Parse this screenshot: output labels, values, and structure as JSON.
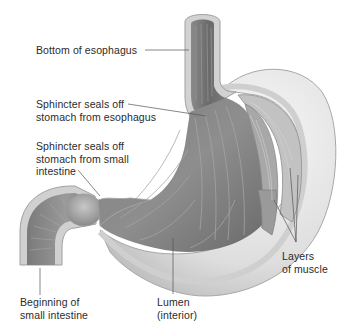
{
  "diagram": {
    "labels": [
      {
        "id": "bottom-esophagus",
        "text": "Bottom of esophagus",
        "x": 36,
        "y": 45
      },
      {
        "id": "sphincter-esophagus",
        "text": "Sphincter seals off\nstomach from esophagus",
        "x": 36,
        "y": 99
      },
      {
        "id": "sphincter-intestine",
        "text": "Sphincter seals off\nstomach from small\nintestine",
        "x": 36,
        "y": 139
      },
      {
        "id": "beginning-intestine",
        "text": "Beginning of\nsmall intestine",
        "x": 20,
        "y": 296
      },
      {
        "id": "lumen",
        "text": "Lumen\n(interior)",
        "x": 157,
        "y": 296
      },
      {
        "id": "muscle-layers",
        "text": "Layers\nof muscle",
        "x": 282,
        "y": 250
      }
    ],
    "colors": {
      "text": "#2b2b2b",
      "leader_line": "#555555",
      "outer_wall": "#d9d9d9",
      "outer_wall_edge": "#a8a8a8",
      "lumen_dark": "#6e6e6e",
      "lumen_mid": "#8c8c8c",
      "muscle": "#b4b4b4"
    }
  }
}
